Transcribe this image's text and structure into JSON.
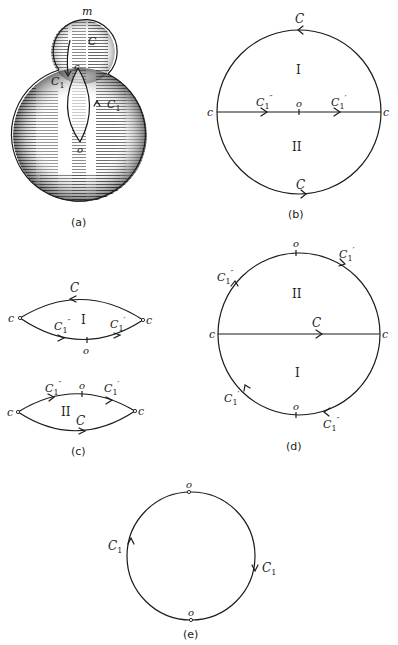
{
  "colors": {
    "ink": "#1a1a1a",
    "background": "#ffffff",
    "shading": "#2a2a2a"
  },
  "panels": {
    "a": {
      "caption": "(a)",
      "labels": {
        "m": "m",
        "C": "C",
        "c": "c",
        "C1_left": "C",
        "C1_left_sub": "1",
        "C1_right": "C",
        "C1_right_sub": "1",
        "o": "o"
      }
    },
    "b": {
      "caption": "(b)",
      "labels": {
        "C_top": "C",
        "C_bottom": "C",
        "region_I": "I",
        "region_II": "II",
        "c_left": "c",
        "c_right": "c",
        "o": "o",
        "C1pp": "C",
        "C1pp_sub": "1",
        "C1pp_prime": "″",
        "C1p": "C",
        "C1p_sub": "1",
        "C1p_prime": "′"
      }
    },
    "c": {
      "caption": "(c)",
      "upper": {
        "C": "C",
        "region": "I",
        "c_left": "c",
        "c_right": "c",
        "o": "o",
        "C1pp": "C",
        "C1pp_sub": "1",
        "C1pp_prime": "″",
        "C1p": "C",
        "C1p_sub": "1",
        "C1p_prime": "′"
      },
      "lower": {
        "C": "C",
        "region": "II",
        "c_left": "c",
        "c_right": "c",
        "o": "o",
        "C1pp": "C",
        "C1pp_sub": "1",
        "C1pp_prime": "″",
        "C1p": "C",
        "C1p_sub": "1",
        "C1p_prime": "′"
      }
    },
    "d": {
      "caption": "(d)",
      "labels": {
        "o_top": "o",
        "o_bottom": "o",
        "region_II": "II",
        "region_I": "I",
        "C": "C",
        "c_left": "c",
        "c_right": "c",
        "C1p_top": "C",
        "C1p_top_sub": "1",
        "C1p_top_prime": "′",
        "C1pp_top": "C",
        "C1pp_top_sub": "1",
        "C1pp_top_prime": "″",
        "C1p_bottom": "C",
        "C1p_bottom_sub": "1",
        "C1p_bottom_prime": "′",
        "C1pp_bottom": "C",
        "C1pp_bottom_sub": "1",
        "C1pp_bottom_prime": "″"
      }
    },
    "e": {
      "caption": "(e)",
      "labels": {
        "o_top": "o",
        "o_bottom": "o",
        "C1_left": "C",
        "C1_left_sub": "1",
        "C1_right": "C",
        "C1_right_sub": "1"
      }
    }
  }
}
